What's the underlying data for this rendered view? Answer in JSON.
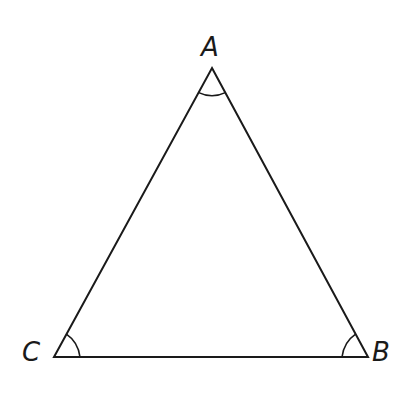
{
  "diagram": {
    "type": "triangle",
    "stroke_color": "#1a1a1a",
    "vertices": {
      "A": {
        "label": "A",
        "x": 212,
        "y": 68
      },
      "B": {
        "label": "B",
        "x": 368,
        "y": 357
      },
      "C": {
        "label": "C",
        "x": 54,
        "y": 357
      }
    },
    "angle_marks": [
      "A",
      "B",
      "C"
    ]
  }
}
